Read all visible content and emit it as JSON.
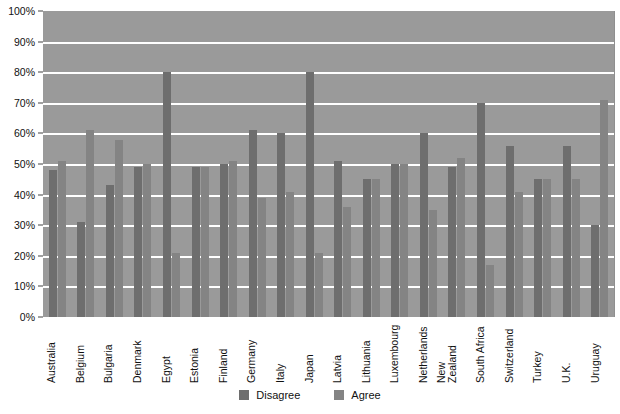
{
  "chart_data": {
    "type": "bar",
    "title": "",
    "xlabel": "",
    "ylabel": "",
    "ylim": [
      0,
      100
    ],
    "grid": true,
    "legend_position": "bottom",
    "tick_labels": [
      "100%",
      "90%",
      "80%",
      "70%",
      "60%",
      "50%",
      "40%",
      "30%",
      "20%",
      "10%",
      "0%"
    ],
    "tick_values": [
      100,
      90,
      80,
      70,
      60,
      50,
      40,
      30,
      20,
      10,
      0
    ],
    "categories": [
      "Australia",
      "Belgium",
      "Bulgaria",
      "Denmark",
      "Egypt",
      "Estonia",
      "Finland",
      "Germany",
      "Italy",
      "Japan",
      "Latvia",
      "Lithuania",
      "Luxembourg",
      "Netherlands",
      "New Zealand",
      "South Africa",
      "Switzerland",
      "Turkey",
      "U.K.",
      "Uruguay"
    ],
    "series": [
      {
        "name": "Disagree",
        "color": "#6e6e6e",
        "values": [
          48,
          31,
          43,
          49,
          80,
          49,
          50,
          61,
          60,
          80,
          51,
          45,
          50,
          60,
          49,
          70,
          56,
          45,
          56,
          30
        ]
      },
      {
        "name": "Agree",
        "color": "#848484",
        "values": [
          51,
          61,
          58,
          50,
          21,
          49,
          51,
          39,
          41,
          21,
          36,
          45,
          50,
          35,
          52,
          17,
          41,
          45,
          45,
          71
        ]
      }
    ]
  },
  "legend": {
    "items": [
      {
        "label": "Disagree",
        "color": "#6e6e6e"
      },
      {
        "label": "Agree",
        "color": "#848484"
      }
    ]
  },
  "style": {
    "plot_background": "#9a9a9a",
    "gridline_color": "#ffffff",
    "page_background": "#ffffff",
    "text_color": "#111111"
  }
}
